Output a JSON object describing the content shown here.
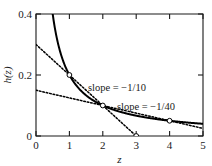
{
  "chart_data": {
    "type": "line",
    "title": "",
    "xlabel": "z",
    "ylabel": "h(z)",
    "xlim": [
      0,
      5
    ],
    "ylim": [
      0,
      0.4
    ],
    "grid": false,
    "legend": "none",
    "xticks": [
      "0",
      "1",
      "2",
      "3",
      "4",
      "5"
    ],
    "xtick_values": [
      0,
      1,
      2,
      3,
      4,
      5
    ],
    "yticks": [
      "0",
      "0.2",
      "0.4"
    ],
    "ytick_values": [
      0,
      0.2,
      0.4
    ],
    "series": [
      {
        "name": "h(z)",
        "style": "solid",
        "formula": "h(z) = 0.2 / z",
        "x": [
          0.5,
          0.6,
          0.7,
          0.8,
          0.9,
          1.0,
          1.2,
          1.4,
          1.6,
          1.8,
          2.0,
          2.25,
          2.5,
          2.75,
          3.0,
          3.5,
          4.0,
          4.5,
          5.0
        ],
        "values": [
          0.4,
          0.333,
          0.286,
          0.25,
          0.222,
          0.2,
          0.167,
          0.143,
          0.125,
          0.111,
          0.1,
          0.089,
          0.08,
          0.073,
          0.067,
          0.057,
          0.05,
          0.044,
          0.04
        ]
      },
      {
        "name": "tangent at z = 1",
        "style": "dotted",
        "slope": -0.1,
        "x": [
          0,
          3
        ],
        "values": [
          0.3,
          0.0
        ]
      },
      {
        "name": "tangent at z = 2",
        "style": "dotted",
        "slope": -0.025,
        "x": [
          0,
          5
        ],
        "values": [
          0.15,
          0.025
        ]
      }
    ],
    "markers": [
      {
        "x": 1,
        "y": 0.2
      },
      {
        "x": 2,
        "y": 0.1
      },
      {
        "x": 3,
        "y": 0.0
      },
      {
        "x": 4,
        "y": 0.05
      }
    ],
    "annotations": [
      {
        "text": "slope = −1/10",
        "x": 1.55,
        "y": 0.145
      },
      {
        "text": "slope = −1/40",
        "x": 2.45,
        "y": 0.098
      }
    ]
  }
}
